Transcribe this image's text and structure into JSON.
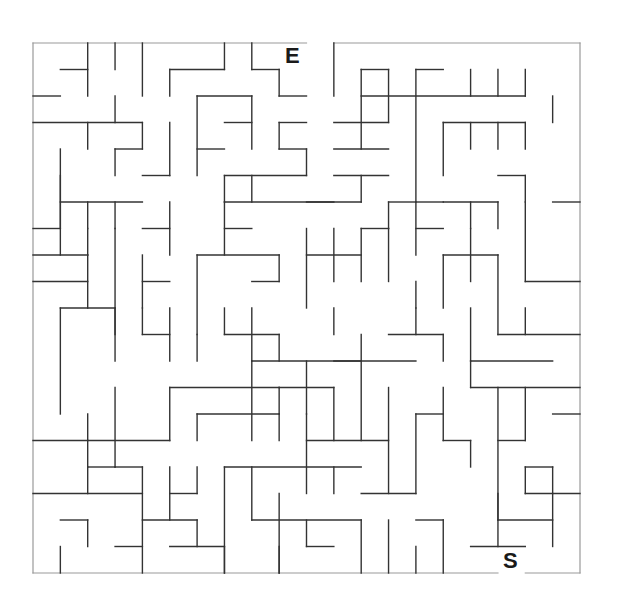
{
  "maze": {
    "cols": 20,
    "rows": 20,
    "origin_x": 33,
    "origin_y": 43,
    "cell_w": 27.35,
    "cell_h": 26.5,
    "wall_color": "#333333",
    "border_color": "#999999",
    "entrance_label": "E",
    "exit_label": "S",
    "entrance_gap": {
      "side": "top",
      "col": 10
    },
    "exit_gap": {
      "side": "bottom",
      "col": 17
    },
    "walls": [
      [
        0,
        0,
        10,
        0
      ],
      [
        11,
        0,
        20,
        0
      ],
      [
        0,
        20,
        17,
        20
      ],
      [
        18,
        20,
        20,
        20
      ],
      [
        0,
        0,
        0,
        20
      ],
      [
        20,
        0,
        20,
        20
      ],
      [
        2,
        0,
        2,
        2
      ],
      [
        3,
        0,
        3,
        1
      ],
      [
        4,
        0,
        4,
        2
      ],
      [
        7,
        0,
        7,
        1
      ],
      [
        8,
        0,
        8,
        1
      ],
      [
        11,
        0,
        11,
        2
      ],
      [
        1,
        1,
        2,
        1
      ],
      [
        5,
        1,
        7,
        1
      ],
      [
        5,
        1,
        5,
        2
      ],
      [
        8,
        1,
        9,
        1
      ],
      [
        9,
        1,
        9,
        2
      ],
      [
        9,
        2,
        10,
        2
      ],
      [
        0,
        2,
        1,
        2
      ],
      [
        6,
        2,
        8,
        2
      ],
      [
        6,
        2,
        6,
        5
      ],
      [
        8,
        2,
        8,
        4
      ],
      [
        3,
        2,
        3,
        3
      ],
      [
        0,
        3,
        4,
        3
      ],
      [
        2,
        3,
        2,
        4
      ],
      [
        4,
        3,
        4,
        4
      ],
      [
        3,
        4,
        4,
        4
      ],
      [
        3,
        4,
        3,
        5
      ],
      [
        1,
        4,
        1,
        7
      ],
      [
        7,
        3,
        8,
        3
      ],
      [
        9,
        3,
        10,
        3
      ],
      [
        9,
        3,
        9,
        4
      ],
      [
        9,
        4,
        10,
        4
      ],
      [
        10,
        4,
        10,
        5
      ],
      [
        6,
        4,
        7,
        4
      ],
      [
        4,
        5,
        5,
        5
      ],
      [
        5,
        3,
        5,
        5
      ],
      [
        7,
        5,
        10,
        5
      ],
      [
        7,
        5,
        7,
        6
      ],
      [
        12,
        1,
        12,
        4
      ],
      [
        12,
        2,
        18,
        2
      ],
      [
        11,
        3,
        13,
        3
      ],
      [
        13,
        1,
        13,
        3
      ],
      [
        12,
        1,
        13,
        1
      ],
      [
        14,
        1,
        14,
        8
      ],
      [
        14,
        1,
        15,
        1
      ],
      [
        16,
        1,
        16,
        2
      ],
      [
        17,
        1,
        17,
        2
      ],
      [
        18,
        1,
        18,
        2
      ],
      [
        15,
        3,
        18,
        3
      ],
      [
        15,
        3,
        15,
        5
      ],
      [
        16,
        3,
        16,
        4
      ],
      [
        17,
        3,
        17,
        4
      ],
      [
        18,
        3,
        18,
        4
      ],
      [
        11,
        4,
        13,
        4
      ],
      [
        11,
        5,
        13,
        5
      ],
      [
        12,
        5,
        12,
        6
      ],
      [
        10,
        6,
        12,
        6
      ],
      [
        13,
        6,
        14,
        6
      ],
      [
        13,
        6,
        13,
        7
      ],
      [
        15,
        6,
        17,
        6
      ],
      [
        16,
        6,
        16,
        7
      ],
      [
        17,
        6,
        17,
        7
      ],
      [
        18,
        6,
        18,
        9
      ],
      [
        19,
        6,
        20,
        6
      ],
      [
        1,
        5,
        1,
        8
      ],
      [
        1,
        6,
        4,
        6
      ],
      [
        2,
        6,
        2,
        7
      ],
      [
        3,
        6,
        3,
        7
      ],
      [
        5,
        6,
        5,
        8
      ],
      [
        4,
        7,
        5,
        7
      ],
      [
        0,
        7,
        1,
        7
      ],
      [
        0,
        8,
        2,
        8
      ],
      [
        2,
        7,
        2,
        8
      ],
      [
        2,
        8,
        2,
        10
      ],
      [
        3,
        7,
        3,
        11
      ],
      [
        7,
        7,
        8,
        7
      ],
      [
        6,
        8,
        6,
        11
      ],
      [
        6,
        8,
        9,
        8
      ],
      [
        9,
        8,
        9,
        9
      ],
      [
        8,
        9,
        9,
        9
      ],
      [
        4,
        8,
        4,
        10
      ],
      [
        4,
        9,
        5,
        9
      ],
      [
        7,
        6,
        11,
        6
      ],
      [
        7,
        6,
        7,
        8
      ],
      [
        8,
        5,
        8,
        6
      ],
      [
        10,
        8,
        12,
        8
      ],
      [
        11,
        7,
        11,
        9
      ],
      [
        12,
        7,
        13,
        7
      ],
      [
        12,
        7,
        12,
        9
      ],
      [
        13,
        7,
        13,
        9
      ],
      [
        10,
        7,
        10,
        10
      ],
      [
        14,
        9,
        14,
        10
      ],
      [
        15,
        8,
        17,
        8
      ],
      [
        15,
        8,
        15,
        10
      ],
      [
        16,
        7,
        16,
        9
      ],
      [
        17,
        8,
        17,
        11
      ],
      [
        18,
        9,
        20,
        9
      ],
      [
        14,
        7,
        15,
        7
      ],
      [
        14,
        6,
        15,
        6
      ],
      [
        18,
        5,
        18,
        6
      ],
      [
        17,
        5,
        18,
        5
      ],
      [
        19,
        2,
        19,
        3
      ],
      [
        0,
        9,
        2,
        9
      ],
      [
        1,
        10,
        1,
        14
      ],
      [
        1,
        10,
        3,
        10
      ],
      [
        3,
        10,
        3,
        12
      ],
      [
        4,
        10,
        4,
        11
      ],
      [
        5,
        10,
        5,
        12
      ],
      [
        4,
        11,
        5,
        11
      ],
      [
        7,
        11,
        9,
        11
      ],
      [
        8,
        10,
        8,
        12
      ],
      [
        7,
        10,
        7,
        11
      ],
      [
        9,
        11,
        9,
        12
      ],
      [
        6,
        11,
        6,
        12
      ],
      [
        8,
        12,
        12,
        12
      ],
      [
        8,
        12,
        8,
        15
      ],
      [
        9,
        13,
        11,
        13
      ],
      [
        9,
        13,
        9,
        14
      ],
      [
        10,
        12,
        10,
        14
      ],
      [
        11,
        10,
        11,
        11
      ],
      [
        12,
        11,
        12,
        15
      ],
      [
        11,
        12,
        14,
        12
      ],
      [
        13,
        11,
        15,
        11
      ],
      [
        15,
        11,
        15,
        12
      ],
      [
        16,
        10,
        16,
        12
      ],
      [
        17,
        11,
        20,
        11
      ],
      [
        16,
        12,
        19,
        12
      ],
      [
        16,
        12,
        16,
        13
      ],
      [
        16,
        13,
        20,
        13
      ],
      [
        18,
        13,
        18,
        15
      ],
      [
        14,
        10,
        14,
        11
      ],
      [
        18,
        10,
        18,
        11
      ],
      [
        5,
        13,
        5,
        15
      ],
      [
        5,
        13,
        9,
        13
      ],
      [
        6,
        14,
        9,
        14
      ],
      [
        6,
        14,
        6,
        15
      ],
      [
        3,
        13,
        3,
        16
      ],
      [
        2,
        14,
        2,
        15
      ],
      [
        0,
        15,
        5,
        15
      ],
      [
        2,
        15,
        2,
        16
      ],
      [
        9,
        14,
        9,
        15
      ],
      [
        10,
        15,
        13,
        15
      ],
      [
        10,
        14,
        10,
        17
      ],
      [
        11,
        13,
        11,
        15
      ],
      [
        13,
        13,
        13,
        17
      ],
      [
        14,
        14,
        14,
        17
      ],
      [
        14,
        14,
        15,
        14
      ],
      [
        15,
        13,
        15,
        15
      ],
      [
        15,
        15,
        16,
        15
      ],
      [
        16,
        15,
        16,
        16
      ],
      [
        17,
        13,
        17,
        18
      ],
      [
        17,
        15,
        18,
        15
      ],
      [
        18,
        16,
        18,
        17
      ],
      [
        18,
        16,
        19,
        16
      ],
      [
        19,
        16,
        19,
        17
      ],
      [
        19,
        14,
        20,
        14
      ],
      [
        2,
        16,
        3,
        16
      ],
      [
        2,
        16,
        2,
        17
      ],
      [
        3,
        16,
        4,
        16
      ],
      [
        4,
        16,
        4,
        20
      ],
      [
        5,
        16,
        5,
        18
      ],
      [
        6,
        16,
        6,
        17
      ],
      [
        5,
        17,
        6,
        17
      ],
      [
        7,
        16,
        7,
        20
      ],
      [
        7,
        16,
        12,
        16
      ],
      [
        8,
        16,
        8,
        18
      ],
      [
        11,
        16,
        11,
        17
      ],
      [
        12,
        17,
        14,
        17
      ],
      [
        0,
        17,
        4,
        17
      ],
      [
        1,
        18,
        2,
        18
      ],
      [
        2,
        18,
        2,
        19
      ],
      [
        3,
        19,
        4,
        19
      ],
      [
        4,
        18,
        6,
        18
      ],
      [
        6,
        18,
        6,
        19
      ],
      [
        5,
        19,
        7,
        19
      ],
      [
        7,
        19,
        7,
        20
      ],
      [
        9,
        17,
        9,
        20
      ],
      [
        8,
        18,
        12,
        18
      ],
      [
        10,
        18,
        10,
        19
      ],
      [
        12,
        18,
        12,
        20
      ],
      [
        10,
        19,
        11,
        19
      ],
      [
        13,
        18,
        13,
        20
      ],
      [
        14,
        18,
        15,
        18
      ],
      [
        15,
        18,
        15,
        20
      ],
      [
        16,
        19,
        18,
        19
      ],
      [
        17,
        17,
        17,
        19
      ],
      [
        17,
        18,
        19,
        18
      ],
      [
        18,
        17,
        20,
        17
      ],
      [
        19,
        17,
        19,
        19
      ],
      [
        1,
        19,
        1,
        20
      ],
      [
        9,
        19,
        9,
        20
      ],
      [
        14,
        19,
        14,
        20
      ]
    ]
  }
}
